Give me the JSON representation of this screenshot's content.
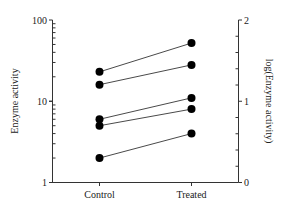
{
  "chart_data": {
    "type": "line",
    "title": "",
    "categories": [
      "Control",
      "Treated"
    ],
    "xlabel": "",
    "ylabel": "Enzyme activity",
    "ylabel_right": "log(Enzyme activity)",
    "yscale": "log",
    "ylim": [
      1,
      100
    ],
    "ylim_right": [
      0,
      2
    ],
    "yticks_left": [
      "1",
      "10",
      "100"
    ],
    "yticks_right": [
      "0",
      "1",
      "2"
    ],
    "grid": false,
    "legend": null,
    "series": [
      {
        "name": "Subject 1",
        "values": [
          23,
          52
        ]
      },
      {
        "name": "Subject 2",
        "values": [
          16,
          28
        ]
      },
      {
        "name": "Subject 3",
        "values": [
          6,
          11
        ]
      },
      {
        "name": "Subject 4",
        "values": [
          5,
          8
        ]
      },
      {
        "name": "Subject 5",
        "values": [
          2,
          4
        ]
      }
    ]
  },
  "labels": {
    "ylabel": "Enzyme activity",
    "ylabel_right": "log(Enzyme activity)",
    "x0": "Control",
    "x1": "Treated",
    "yl_1": "1",
    "yl_10": "10",
    "yl_100": "100",
    "yr_0": "0",
    "yr_1": "1",
    "yr_2": "2"
  },
  "colors": {
    "line": "#4a4a4a",
    "marker": "#000000",
    "axis": "#333333"
  }
}
